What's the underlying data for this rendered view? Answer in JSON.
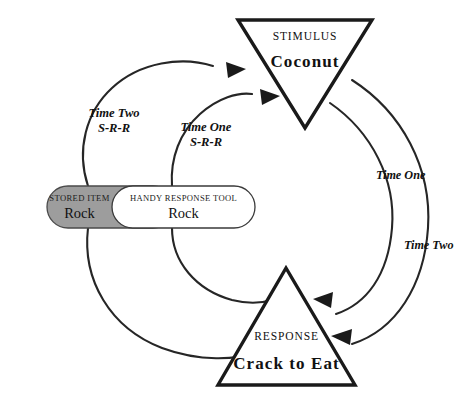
{
  "diagram": {
    "background_color": "#ffffff",
    "line_color": "#262626",
    "stored_item_fill": "#9d9d9d",
    "tool_fill": "#ffffff"
  },
  "stimulus_node": {
    "shape": "inverted-triangle",
    "title": "STIMULUS",
    "value": "Coconut"
  },
  "response_node": {
    "shape": "triangle",
    "title": "RESPONSE",
    "value": "Crack to Eat"
  },
  "stored_item_node": {
    "shape": "capsule",
    "title": "STORED ITEM",
    "value": "Rock"
  },
  "tool_node": {
    "shape": "capsule",
    "title": "HANDY RESPONSE TOOL",
    "value": "Rock"
  },
  "path_labels": {
    "left_outer": {
      "line1": "Time Two",
      "line2": "S-R-R"
    },
    "left_inner": {
      "line1": "Time One",
      "line2": "S-R-R"
    },
    "right_inner": {
      "line1": "Time",
      "line2": "One"
    },
    "right_outer": {
      "line1": "Time",
      "line2": "Two"
    }
  }
}
